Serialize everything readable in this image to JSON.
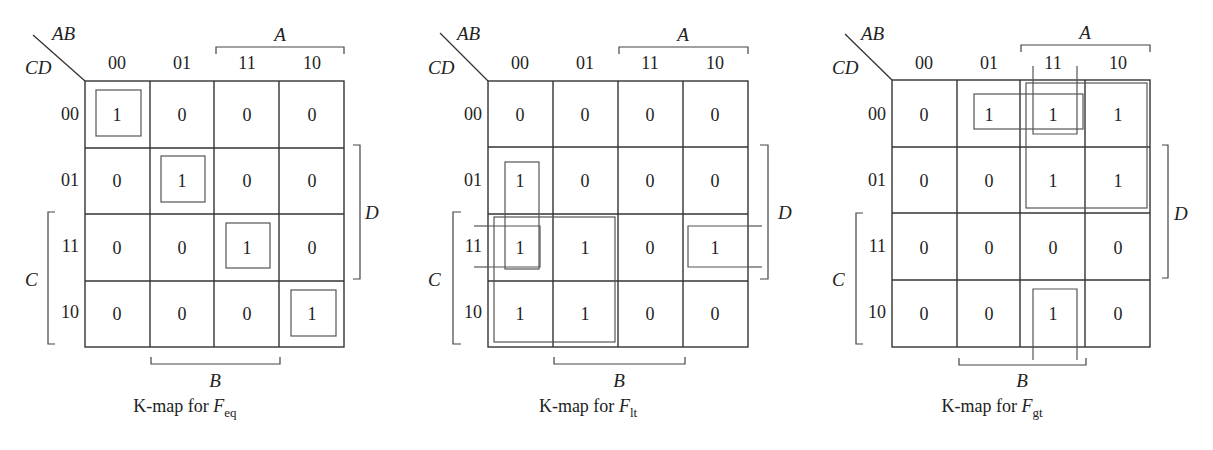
{
  "figure": {
    "row_var_label": "CD",
    "col_var_label": "AB",
    "col_codes": [
      "00",
      "01",
      "11",
      "10"
    ],
    "row_codes": [
      "00",
      "01",
      "11",
      "10"
    ],
    "bracket_labels": {
      "A": "A",
      "B": "B",
      "C": "C",
      "D": "D"
    }
  },
  "maps": [
    {
      "id": "eq",
      "caption_prefix": "K-map for ",
      "caption_var": "F",
      "caption_sub": "eq",
      "cells": [
        [
          "1",
          "0",
          "0",
          "0"
        ],
        [
          "0",
          "1",
          "0",
          "0"
        ],
        [
          "0",
          "0",
          "1",
          "0"
        ],
        [
          "0",
          "0",
          "0",
          "1"
        ]
      ],
      "groups": [
        {
          "rows": [
            0
          ],
          "cols": [
            0
          ]
        },
        {
          "rows": [
            1
          ],
          "cols": [
            1
          ]
        },
        {
          "rows": [
            2
          ],
          "cols": [
            2
          ]
        },
        {
          "rows": [
            3
          ],
          "cols": [
            3
          ]
        }
      ]
    },
    {
      "id": "lt",
      "caption_prefix": "K-map for ",
      "caption_var": "F",
      "caption_sub": "lt",
      "cells": [
        [
          "0",
          "0",
          "0",
          "0"
        ],
        [
          "1",
          "0",
          "0",
          "0"
        ],
        [
          "1",
          "1",
          "0",
          "1"
        ],
        [
          "1",
          "1",
          "0",
          "0"
        ]
      ],
      "groups": [
        {
          "rows": [
            1,
            2
          ],
          "cols": [
            0
          ]
        },
        {
          "rows": [
            2,
            3
          ],
          "cols": [
            0,
            1
          ]
        },
        {
          "rows": [
            2
          ],
          "cols": [
            3,
            0
          ],
          "wrap": "horizontal"
        }
      ]
    },
    {
      "id": "gt",
      "caption_prefix": "K-map for ",
      "caption_var": "F",
      "caption_sub": "gt",
      "cells": [
        [
          "0",
          "1",
          "1",
          "1"
        ],
        [
          "0",
          "0",
          "1",
          "1"
        ],
        [
          "0",
          "0",
          "0",
          "0"
        ],
        [
          "0",
          "0",
          "1",
          "0"
        ]
      ],
      "groups": [
        {
          "rows": [
            0
          ],
          "cols": [
            1,
            2
          ]
        },
        {
          "rows": [
            0,
            1
          ],
          "cols": [
            2,
            3
          ]
        },
        {
          "rows": [
            3,
            0
          ],
          "cols": [
            2
          ],
          "wrap": "vertical"
        }
      ]
    }
  ]
}
